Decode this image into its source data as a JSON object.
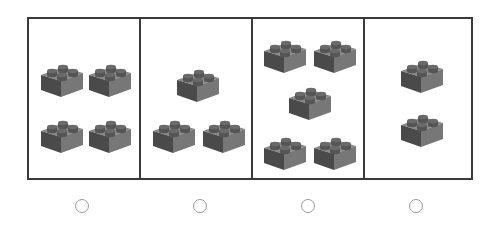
{
  "question": {
    "type": "counting-choice",
    "object_icon": "lego-brick-icon",
    "options": [
      {
        "id": "A",
        "count": 4,
        "bricks": [
          [
            10,
            40
          ],
          [
            58,
            40
          ],
          [
            10,
            96
          ],
          [
            58,
            96
          ]
        ]
      },
      {
        "id": "B",
        "count": 3,
        "bricks": [
          [
            34,
            45
          ],
          [
            10,
            96
          ],
          [
            60,
            96
          ]
        ]
      },
      {
        "id": "C",
        "count": 5,
        "bricks": [
          [
            9,
            16
          ],
          [
            59,
            16
          ],
          [
            34,
            63
          ],
          [
            9,
            113
          ],
          [
            59,
            113
          ]
        ]
      },
      {
        "id": "D",
        "count": 2,
        "bricks": [
          [
            34,
            36
          ],
          [
            34,
            90
          ]
        ]
      }
    ],
    "selected": null
  },
  "colors": {
    "border": "#3a3a3a",
    "brick_top": "#8a8a8a",
    "brick_front": "#777777",
    "brick_side": "#4a4a4a",
    "radio_border": "#9a9a9a"
  }
}
